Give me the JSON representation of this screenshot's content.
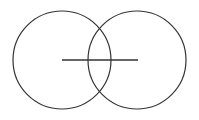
{
  "diagram": {
    "type": "venn-with-segment",
    "stroke_color": "#333333",
    "background": "#ffffff",
    "circles": [
      {
        "name": "left-circle",
        "cx": 62,
        "cy": 60,
        "r": 49
      },
      {
        "name": "right-circle",
        "cx": 137,
        "cy": 60,
        "r": 49
      }
    ],
    "segment": {
      "x1": 62,
      "y1": 60,
      "x2": 138,
      "y2": 60
    }
  }
}
